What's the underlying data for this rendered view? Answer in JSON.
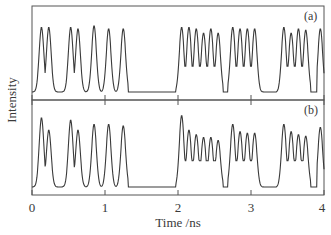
{
  "chart_data": {
    "type": "line",
    "layout": "two vertically stacked panels sharing x-axis",
    "xlabel": "Time /ns",
    "ylabel": "Intensity",
    "xlim": [
      0,
      4
    ],
    "x_ticks": [
      0,
      1,
      2,
      3,
      4
    ],
    "x_tick_labels": [
      "0",
      "1",
      "2",
      "3",
      "4"
    ],
    "grid": false,
    "legend": null,
    "line_color": "#3a3a3a",
    "panels": [
      {
        "label": "(a)",
        "description": "Pulse train with roughly equal peak heights",
        "peaks_ns": [
          0.13,
          0.23,
          0.53,
          0.63,
          0.85,
          1.05,
          1.25,
          2.05,
          2.15,
          2.25,
          2.35,
          2.45,
          2.55,
          2.75,
          2.85,
          2.95,
          3.05,
          3.45,
          3.55,
          3.65,
          3.75,
          3.95
        ],
        "peak_heights": [
          0.9,
          0.9,
          0.9,
          0.88,
          0.92,
          0.88,
          0.88,
          0.9,
          0.9,
          0.88,
          0.82,
          0.88,
          0.82,
          0.9,
          0.88,
          0.88,
          0.88,
          0.9,
          0.82,
          0.88,
          0.86,
          0.88
        ],
        "flat_regions_ns": [
          [
            1.32,
            1.97
          ],
          [
            2.62,
            2.68
          ],
          [
            3.2,
            3.35
          ],
          [
            3.82,
            3.9
          ]
        ],
        "baseline": 0.05,
        "valley_level_in_combs": 0.4
      },
      {
        "label": "(b)",
        "description": "Same pulse train with leading-peak overshoot and decaying amplitudes within groups",
        "peaks_ns": [
          0.13,
          0.23,
          0.53,
          0.63,
          0.85,
          1.05,
          1.25,
          2.05,
          2.15,
          2.25,
          2.35,
          2.45,
          2.55,
          2.75,
          2.85,
          2.95,
          3.05,
          3.45,
          3.55,
          3.65,
          3.75,
          3.95
        ],
        "peak_heights": [
          0.95,
          0.78,
          0.92,
          0.78,
          0.86,
          0.86,
          0.84,
          0.98,
          0.78,
          0.72,
          0.68,
          0.68,
          0.64,
          0.86,
          0.76,
          0.74,
          0.74,
          0.86,
          0.76,
          0.72,
          0.7,
          0.82
        ],
        "flat_regions_ns": [
          [
            1.32,
            1.97
          ],
          [
            2.62,
            2.68
          ],
          [
            3.2,
            3.35
          ],
          [
            3.82,
            3.9
          ]
        ],
        "baseline": 0.05,
        "valley_level_in_combs": 0.4
      }
    ]
  }
}
